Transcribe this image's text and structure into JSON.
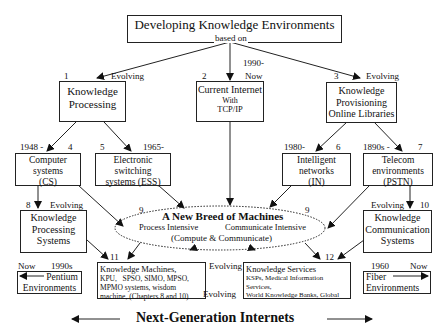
{
  "title": {
    "main": "Developing Knowledge Environments",
    "sub": "based on"
  },
  "level1": [
    {
      "num": "1",
      "tag": "Evolving",
      "lines": [
        "Knowledge",
        "Processing"
      ]
    },
    {
      "num": "2",
      "tag_top": "1990-",
      "tag": "Now",
      "lines": [
        "Current Internet",
        "With",
        "TCP/IP"
      ]
    },
    {
      "num": "3",
      "tag": "Evolving",
      "lines": [
        "Knowledge",
        "Provisioning",
        "Online Libraries"
      ]
    }
  ],
  "level2": [
    {
      "num": "4",
      "year": "1948 -",
      "lines": [
        "Computer",
        "systems",
        "(CS)"
      ]
    },
    {
      "num": "5",
      "year": "1965-",
      "lines": [
        "Electronic",
        "switching",
        "systems (ESS)"
      ]
    },
    {
      "num": "6",
      "year": "1980-",
      "lines": [
        "Intelligent",
        "networks",
        "(IN)"
      ]
    },
    {
      "num": "7",
      "year": "1890s -",
      "lines": [
        "Telecom",
        "environments",
        "(PSTN)"
      ]
    }
  ],
  "level3": [
    {
      "num": "8",
      "tag": "Evolving",
      "lines": [
        "Knowledge",
        "Processing",
        "Systems"
      ]
    },
    {
      "num": "10",
      "tag": "Evolving",
      "lines": [
        "Knowledge",
        "Communication",
        "Systems"
      ]
    }
  ],
  "center": {
    "num_left": "9",
    "num_right": "9",
    "title": "A New Breed of Machines",
    "left": "Process Intensive",
    "right": "Communicate Intensive",
    "bottom": "(Compute & Communicate)"
  },
  "level4": [
    {
      "num": "11",
      "lines": [
        "Knowledge Machines,",
        "KPU,   SPSO, SIMO, MPSO,",
        "MPMO systems, wisdom",
        "machine, (Chapters 8 and 10)"
      ]
    },
    {
      "num": "12",
      "lines": [
        "Knowledge Services",
        "KSPs, Medical Information Services,",
        "World Knowledge Banks, Global",
        "Universities, Religious Institutions"
      ]
    }
  ],
  "evolving_mid": [
    "Evolving",
    "Evolving"
  ],
  "side_left": {
    "from": "Now",
    "to": "1990s",
    "lines": [
      "Pentium",
      "Environments"
    ]
  },
  "side_right": {
    "from": "1960",
    "to": "Now",
    "lines": [
      "Fiber",
      "Environments"
    ]
  },
  "footer": "Next-Generation Internets"
}
